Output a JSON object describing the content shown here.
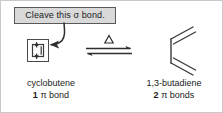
{
  "figure": {
    "type": "chemical-reaction-scheme",
    "background_color": "#ffffff",
    "border_color": "#c9c9c9"
  },
  "callout": {
    "text": "Cleave this σ bond.",
    "fill_color": "#d9d9d9",
    "border_color": "#5a5a5a",
    "pointer": "curved-arrow-to-reactant"
  },
  "reactant": {
    "structure_name": "cyclobutene-skeletal-structure",
    "caption_name": "cyclobutene",
    "caption_count": "1",
    "caption_unit": "π bond",
    "bond_highlight": "sigma-bond-cleavage-arrows"
  },
  "arrow": {
    "label": "Δ",
    "kind": "equilibrium-double-arrow",
    "forward_direction": "right",
    "reverse_direction": "left"
  },
  "product": {
    "structure_name": "1,3-butadiene-skeletal-structure",
    "caption_name": "1,3-butadiene",
    "caption_count": "2",
    "caption_unit": "π bonds"
  },
  "colors": {
    "line": "#3a3a3a",
    "text": "#1a1a1a"
  }
}
